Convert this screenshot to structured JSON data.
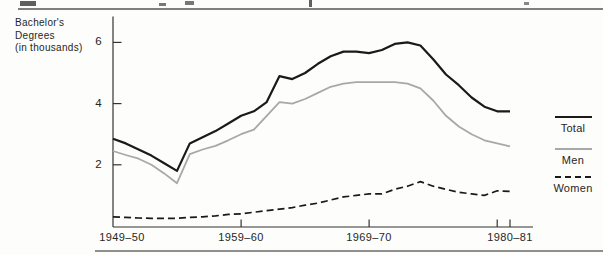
{
  "page": {
    "header_note": "cropped line of text above rule (fragments only)"
  },
  "chart": {
    "ylabel_lines": [
      "Bachelor's",
      "Degrees",
      "(in thousands)"
    ],
    "y_labels": [
      "6",
      "4",
      "2"
    ],
    "x_labels": [
      "1949–50",
      "1959–60",
      "1969–70",
      "1980–81"
    ]
  },
  "legend": {
    "items": [
      {
        "label": "Total",
        "color": "#1a1a1a",
        "dashed": false
      },
      {
        "label": "Men",
        "color": "#a8a8a8",
        "dashed": false
      },
      {
        "label": "Women",
        "color": "#1a1a1a",
        "dashed": true
      }
    ]
  },
  "colors": {
    "total_line": "#1a1a1a",
    "men_line": "#a8a8a8",
    "women_line": "#1a1a1a",
    "axis": "#333333",
    "rule": "#7f7f7f",
    "background": "#fdfdfb"
  },
  "chart_data": {
    "type": "line",
    "title": "",
    "xlabel": "",
    "ylabel": "Bachelor's Degrees (in thousands)",
    "ylim": [
      0,
      6.8
    ],
    "yticks": [
      2,
      4,
      6
    ],
    "grid": false,
    "legend_position": "right-outside",
    "x": [
      "1949-50",
      "1950-51",
      "1951-52",
      "1952-53",
      "1953-54",
      "1954-55",
      "1955-56",
      "1956-57",
      "1957-58",
      "1958-59",
      "1959-60",
      "1960-61",
      "1961-62",
      "1962-63",
      "1963-64",
      "1964-65",
      "1965-66",
      "1966-67",
      "1967-68",
      "1968-69",
      "1969-70",
      "1970-71",
      "1971-72",
      "1972-73",
      "1973-74",
      "1974-75",
      "1975-76",
      "1976-77",
      "1977-78",
      "1978-79",
      "1979-80",
      "1980-81"
    ],
    "xtick_indices": [
      10,
      20,
      30,
      31
    ],
    "series": [
      {
        "name": "Total",
        "color": "#1a1a1a",
        "width": 2.2,
        "dash": null,
        "values": [
          2.85,
          2.7,
          2.5,
          2.3,
          2.05,
          1.8,
          2.7,
          2.9,
          3.1,
          3.35,
          3.6,
          3.75,
          4.05,
          4.9,
          4.8,
          5.0,
          5.3,
          5.55,
          5.7,
          5.7,
          5.65,
          5.75,
          5.95,
          6.0,
          5.9,
          5.45,
          4.95,
          4.6,
          4.2,
          3.9,
          3.75,
          3.75
        ]
      },
      {
        "name": "Men",
        "color": "#a8a8a8",
        "width": 1.8,
        "dash": null,
        "values": [
          2.45,
          2.32,
          2.2,
          2.0,
          1.72,
          1.4,
          2.35,
          2.5,
          2.62,
          2.8,
          3.0,
          3.15,
          3.6,
          4.05,
          4.0,
          4.15,
          4.35,
          4.55,
          4.65,
          4.7,
          4.7,
          4.7,
          4.7,
          4.65,
          4.5,
          4.1,
          3.6,
          3.25,
          3.0,
          2.8,
          2.7,
          2.6
        ]
      },
      {
        "name": "Women",
        "color": "#1a1a1a",
        "width": 1.7,
        "dash": "7 4",
        "values": [
          0.3,
          0.28,
          0.26,
          0.25,
          0.25,
          0.25,
          0.28,
          0.3,
          0.33,
          0.38,
          0.4,
          0.45,
          0.5,
          0.55,
          0.6,
          0.68,
          0.75,
          0.85,
          0.95,
          1.0,
          1.05,
          1.05,
          1.2,
          1.3,
          1.45,
          1.3,
          1.2,
          1.1,
          1.05,
          1.0,
          1.15,
          1.13
        ]
      }
    ]
  }
}
